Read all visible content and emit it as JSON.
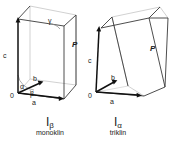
{
  "figure": {
    "type": "diagram",
    "background_color": "#ffffff",
    "line_color_solid": "#333333",
    "line_color_faint": "#b9b9b9",
    "vector_color": "#111111",
    "arc_color": "#8a8a8a"
  },
  "cells": [
    {
      "id": "left",
      "caption_symbol": "I",
      "caption_subscript": "β",
      "caption_name": "monoklin",
      "origin_label": "0",
      "plane_label": "P",
      "vectors": [
        {
          "name": "a",
          "label": "a"
        },
        {
          "name": "b",
          "label": "b"
        },
        {
          "name": "c",
          "label": "c"
        }
      ],
      "angles": [
        {
          "name": "alpha",
          "label": "α"
        },
        {
          "name": "beta",
          "label": "β"
        },
        {
          "name": "gamma",
          "label": "γ"
        }
      ]
    },
    {
      "id": "right",
      "caption_symbol": "I",
      "caption_subscript": "α",
      "caption_name": "triklin",
      "origin_label": "0",
      "plane_label": "P",
      "vectors": [
        {
          "name": "a",
          "label": "a"
        },
        {
          "name": "b",
          "label": "b"
        },
        {
          "name": "c",
          "label": "c"
        }
      ],
      "angles": []
    }
  ]
}
